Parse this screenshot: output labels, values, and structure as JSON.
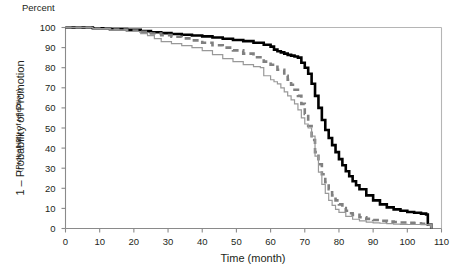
{
  "chart_data": {
    "type": "line",
    "title": "",
    "top_left_label": "Percent",
    "xlabel": "Time (month)",
    "ylabel": "1 – Probability of Promotion",
    "ylabel_sub": "(Probability of rejection)",
    "xlim": [
      0,
      110
    ],
    "ylim": [
      0,
      100
    ],
    "xticks": [
      0,
      10,
      20,
      30,
      40,
      50,
      60,
      70,
      80,
      90,
      100,
      110
    ],
    "yticks": [
      0,
      10,
      20,
      30,
      40,
      50,
      60,
      70,
      80,
      90,
      100
    ],
    "grid": false,
    "legend": "none",
    "step": true,
    "series": [
      {
        "name": "upper-curve",
        "style": "solid",
        "color": "#000000",
        "width": 2.6,
        "x": [
          0,
          3,
          8,
          13,
          18,
          22,
          25,
          28,
          31,
          34,
          37,
          40,
          43,
          46,
          49,
          52,
          55,
          58,
          60,
          61,
          62,
          63,
          64,
          65,
          66,
          67,
          68,
          69,
          70,
          71,
          72,
          73,
          74,
          75,
          76,
          77,
          78,
          79,
          80,
          81,
          82,
          83,
          84,
          85,
          86,
          88,
          90,
          92,
          94,
          96,
          98,
          100,
          102,
          104,
          105.5,
          106,
          107
        ],
        "y": [
          100,
          100,
          99.6,
          99.2,
          98.8,
          98.2,
          97.6,
          97.2,
          96.8,
          96.4,
          96.0,
          95.6,
          95.0,
          94.4,
          93.8,
          93.2,
          92.4,
          91.4,
          90.5,
          89.0,
          88.2,
          87.6,
          87.0,
          86.4,
          86.0,
          85.6,
          85.0,
          82.5,
          80.0,
          77.0,
          72.0,
          66.0,
          60.0,
          54.0,
          49.0,
          45.0,
          41.5,
          38.0,
          34.5,
          31.5,
          28.5,
          26.0,
          23.5,
          21.5,
          19.5,
          16.5,
          14.0,
          12.0,
          10.5,
          9.5,
          8.8,
          8.2,
          7.8,
          7.4,
          7.0,
          2.0,
          0.0
        ]
      },
      {
        "name": "middle-curve",
        "style": "dashed",
        "color": "#808080",
        "width": 2.6,
        "dash": "6,4",
        "x": [
          0,
          3,
          8,
          13,
          18,
          22,
          25,
          28,
          31,
          34,
          37,
          40,
          43,
          46,
          49,
          52,
          55,
          58,
          60,
          62,
          64,
          65,
          66,
          67,
          68,
          69,
          70,
          71,
          72,
          73,
          74,
          75,
          76,
          77,
          78,
          79,
          80,
          81,
          82,
          83,
          84,
          86,
          88,
          90,
          92,
          94,
          96,
          98,
          100,
          102,
          104,
          106,
          107
        ],
        "y": [
          100,
          100,
          99.5,
          99.0,
          98.5,
          97.8,
          97.0,
          96.2,
          95.4,
          94.6,
          93.6,
          92.4,
          91.2,
          90.0,
          88.6,
          87.0,
          85.2,
          83.0,
          81.5,
          79.0,
          76.0,
          74.0,
          71.5,
          69.0,
          66.0,
          62.0,
          57.0,
          51.0,
          44.0,
          38.0,
          32.0,
          27.0,
          23.0,
          19.5,
          16.5,
          14.0,
          12.0,
          10.2,
          8.8,
          7.6,
          6.8,
          5.6,
          4.8,
          4.2,
          3.8,
          3.4,
          3.2,
          3.0,
          2.8,
          2.6,
          2.4,
          2.0,
          0.0
        ]
      },
      {
        "name": "lower-curve",
        "style": "solid",
        "color": "#999999",
        "width": 1.2,
        "x": [
          0,
          3,
          8,
          13,
          18,
          22,
          24,
          26,
          28,
          31,
          34,
          37,
          40,
          43,
          46,
          49,
          52,
          55,
          57,
          58,
          60,
          61,
          62,
          63,
          64,
          65,
          66,
          67,
          68,
          69,
          70,
          71,
          72,
          73,
          74,
          75,
          76,
          77,
          78,
          79,
          80,
          82,
          84,
          86,
          88,
          90,
          92,
          94,
          96,
          98,
          100,
          102,
          104,
          106,
          107
        ],
        "y": [
          100,
          100,
          99.4,
          98.8,
          98.0,
          97.0,
          96.0,
          94.5,
          93.0,
          92.0,
          91.0,
          90.0,
          88.5,
          86.5,
          84.5,
          83.0,
          81.5,
          80.5,
          80.0,
          76.0,
          74.0,
          73.0,
          72.0,
          70.0,
          68.0,
          66.0,
          64.0,
          62.0,
          59.0,
          55.0,
          52.0,
          50.0,
          46.0,
          36.0,
          28.0,
          22.0,
          17.5,
          14.0,
          11.5,
          9.5,
          8.0,
          6.0,
          4.6,
          3.8,
          3.2,
          2.8,
          2.6,
          2.4,
          2.2,
          2.1,
          2.0,
          2.0,
          1.9,
          1.8,
          0.0
        ]
      }
    ]
  }
}
